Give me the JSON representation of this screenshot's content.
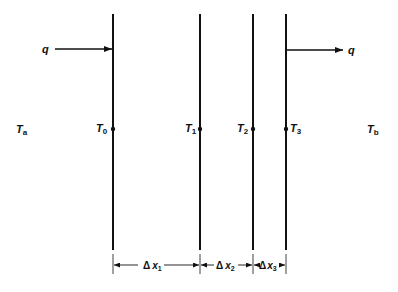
{
  "diagram": {
    "title": "",
    "ambient_left": {
      "symbol": "T",
      "sub": "a"
    },
    "ambient_right": {
      "symbol": "T",
      "sub": "b"
    },
    "heat_in": {
      "label": "q"
    },
    "heat_out": {
      "label": "q"
    },
    "surfaces": [
      {
        "symbol": "T",
        "sub": "0",
        "x": 113
      },
      {
        "symbol": "T",
        "sub": "1",
        "x": 200
      },
      {
        "symbol": "T",
        "sub": "2",
        "x": 253
      },
      {
        "symbol": "T",
        "sub": "3",
        "x": 286
      }
    ],
    "dimensions": [
      {
        "delta": "Δ",
        "var": "x",
        "sub": "1"
      },
      {
        "delta": "Δ",
        "var": "x",
        "sub": "2"
      },
      {
        "delta": "Δ",
        "var": "x",
        "sub": "3"
      }
    ],
    "colors": {
      "ink": "#111111",
      "background": "#ffffff"
    }
  }
}
